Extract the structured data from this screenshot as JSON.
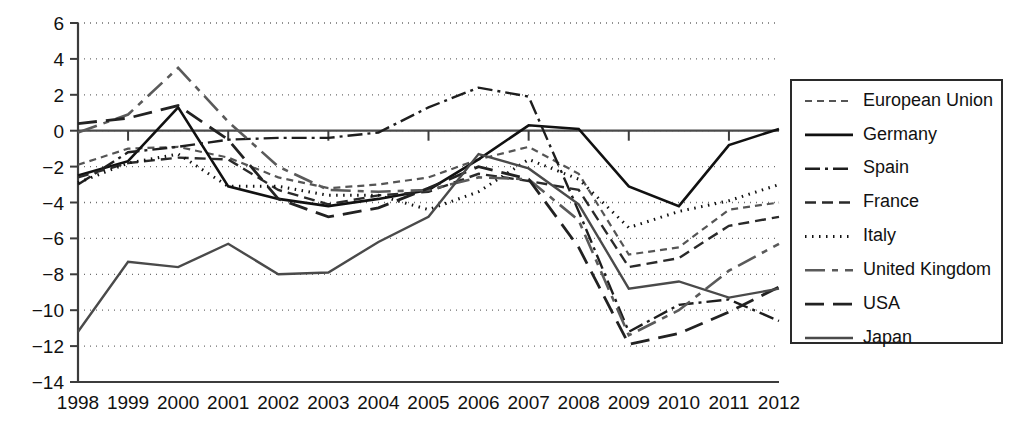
{
  "chart_data": {
    "type": "line",
    "title": "",
    "subtitle": "",
    "xlabel": "",
    "ylabel": "",
    "x": [
      1998,
      1999,
      2000,
      2001,
      2002,
      2003,
      2004,
      2005,
      2006,
      2007,
      2008,
      2009,
      2010,
      2011,
      2012
    ],
    "categories": [
      "1998",
      "1999",
      "2000",
      "2001",
      "2002",
      "2003",
      "2004",
      "2005",
      "2006",
      "2007",
      "2008",
      "2009",
      "2010",
      "2011",
      "2012"
    ],
    "xlim": [
      1998,
      2012
    ],
    "ylim": [
      -14,
      6
    ],
    "yticks": [
      6,
      4,
      2,
      0,
      -2,
      -4,
      -6,
      -8,
      -10,
      -12,
      -14
    ],
    "ytick_labels": [
      "6",
      "4",
      "2",
      "0",
      "−2",
      "−4",
      "−6",
      "−8",
      "−10",
      "−12",
      "−14"
    ],
    "grid": "horizontal-dotted",
    "legend_position": "right-outside",
    "zero_reference_line": true,
    "series": [
      {
        "name": "European Union",
        "dash": "short-dash",
        "color": "#555555",
        "width": 2.2,
        "values": [
          -1.9,
          -1.0,
          -0.9,
          -1.5,
          -2.6,
          -3.2,
          -3.0,
          -2.6,
          -1.6,
          -0.9,
          -2.4,
          -6.9,
          -6.5,
          -4.4,
          -4.0
        ]
      },
      {
        "name": "Germany",
        "dash": "solid",
        "color": "#111111",
        "width": 2.6,
        "values": [
          -2.5,
          -1.7,
          1.3,
          -3.1,
          -3.8,
          -4.2,
          -3.8,
          -3.3,
          -1.6,
          0.3,
          0.1,
          -3.1,
          -4.2,
          -0.8,
          0.1
        ]
      },
      {
        "name": "Spain",
        "dash": "dash-dot",
        "color": "#1e1e1e",
        "width": 2.4,
        "values": [
          -3.0,
          -1.2,
          -0.9,
          -0.5,
          -0.4,
          -0.4,
          -0.1,
          1.3,
          2.4,
          1.9,
          -4.5,
          -11.2,
          -9.7,
          -9.4,
          -10.6
        ]
      },
      {
        "name": "France",
        "dash": "medium-dash",
        "color": "#2a2a2a",
        "width": 2.4,
        "values": [
          -2.6,
          -1.8,
          -1.5,
          -1.6,
          -3.3,
          -4.1,
          -3.6,
          -3.4,
          -2.4,
          -2.8,
          -3.3,
          -7.6,
          -7.1,
          -5.3,
          -4.8
        ]
      },
      {
        "name": "Italy",
        "dash": "dotted",
        "color": "#111111",
        "width": 3.0,
        "values": [
          -2.9,
          -1.8,
          -1.3,
          -3.1,
          -3.1,
          -3.6,
          -3.6,
          -4.4,
          -3.4,
          -1.6,
          -2.7,
          -5.4,
          -4.5,
          -3.9,
          -3.0
        ]
      },
      {
        "name": "United Kingdom",
        "dash": "long-short-dash",
        "color": "#5a5a5a",
        "width": 2.6,
        "values": [
          -0.1,
          0.9,
          3.5,
          0.5,
          -2.0,
          -3.3,
          -3.4,
          -3.3,
          -2.6,
          -2.7,
          -5.0,
          -11.4,
          -10.0,
          -7.8,
          -6.3
        ]
      },
      {
        "name": "USA",
        "dash": "long-dash",
        "color": "#222222",
        "width": 2.8,
        "values": [
          0.4,
          0.7,
          1.4,
          -0.5,
          -3.8,
          -4.8,
          -4.3,
          -3.2,
          -2.0,
          -2.7,
          -6.5,
          -11.9,
          -11.3,
          -10.1,
          -8.7
        ]
      },
      {
        "name": "Japan",
        "dash": "solid",
        "color": "#4a4a4a",
        "width": 2.4,
        "values": [
          -11.2,
          -7.3,
          -7.6,
          -6.3,
          -8.0,
          -7.9,
          -6.2,
          -4.8,
          -1.3,
          -2.1,
          -4.1,
          -8.8,
          -8.4,
          -9.3,
          -8.8
        ]
      }
    ]
  },
  "legend": {
    "items": [
      {
        "label": "European Union"
      },
      {
        "label": "Germany"
      },
      {
        "label": "Spain"
      },
      {
        "label": "France"
      },
      {
        "label": "Italy"
      },
      {
        "label": "United Kingdom"
      },
      {
        "label": "USA"
      },
      {
        "label": "Japan"
      }
    ]
  }
}
